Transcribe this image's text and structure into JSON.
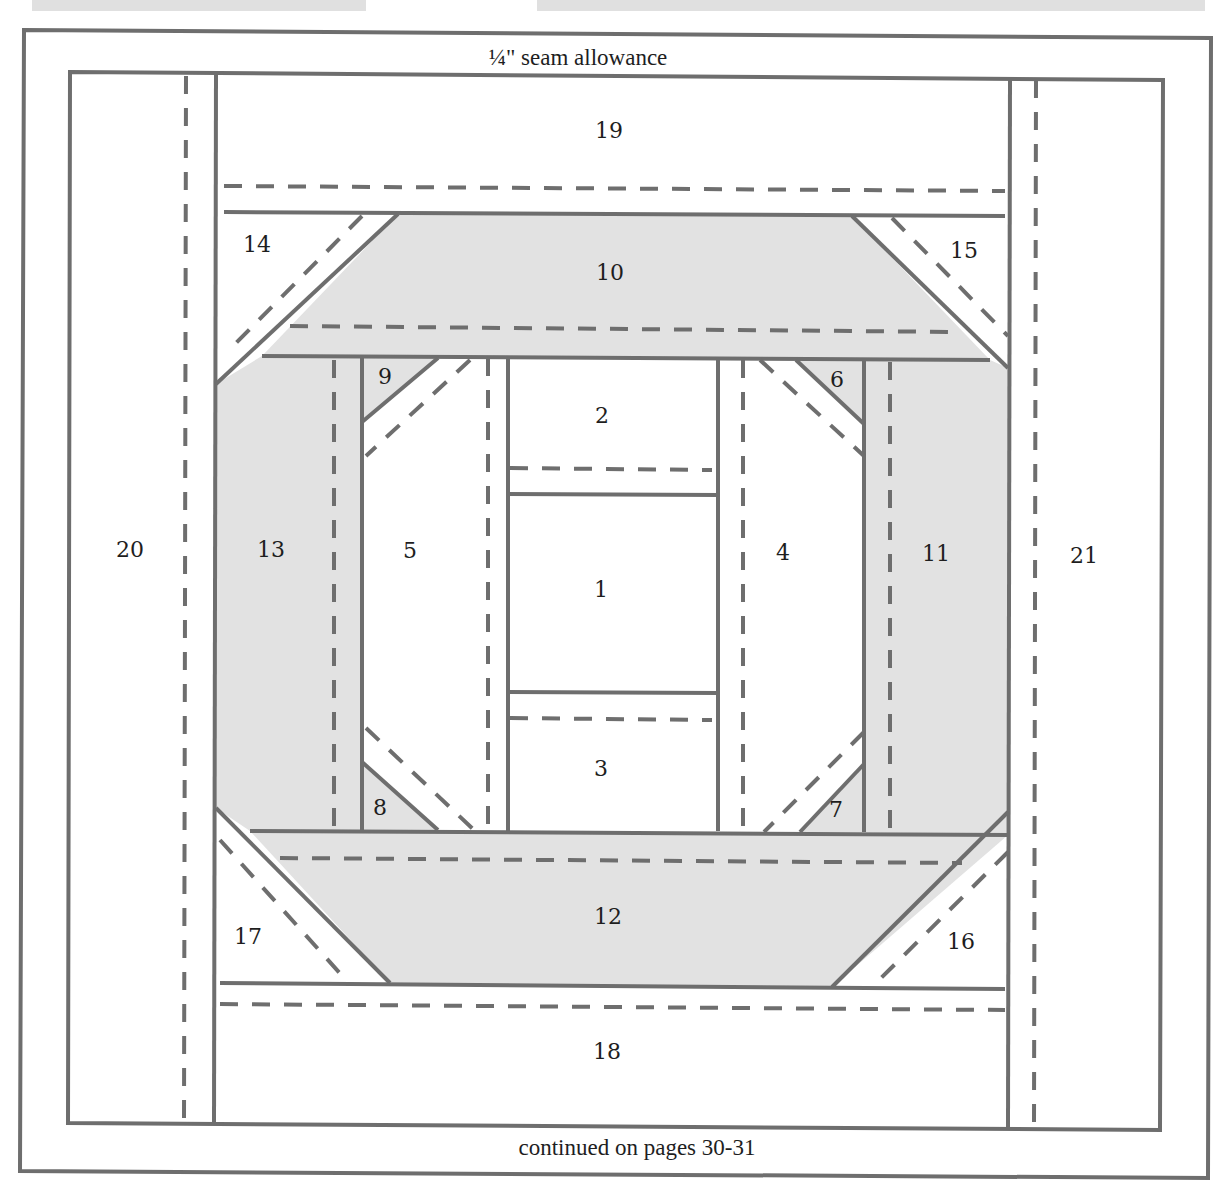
{
  "header": {
    "seam_label": "¼\" seam allowance"
  },
  "footer": {
    "continued_label": "continued on pages 30-31"
  },
  "colors": {
    "line": "#6e6e6e",
    "shaded_fabric": "#e2e2e2",
    "background": "#ffffff"
  },
  "pieces": [
    {
      "num": "1",
      "shaded": false
    },
    {
      "num": "2",
      "shaded": false
    },
    {
      "num": "3",
      "shaded": false
    },
    {
      "num": "4",
      "shaded": false
    },
    {
      "num": "5",
      "shaded": false
    },
    {
      "num": "6",
      "shaded": true
    },
    {
      "num": "7",
      "shaded": true
    },
    {
      "num": "8",
      "shaded": true
    },
    {
      "num": "9",
      "shaded": true
    },
    {
      "num": "10",
      "shaded": true
    },
    {
      "num": "11",
      "shaded": true
    },
    {
      "num": "12",
      "shaded": true
    },
    {
      "num": "13",
      "shaded": true
    },
    {
      "num": "14",
      "shaded": false
    },
    {
      "num": "15",
      "shaded": false
    },
    {
      "num": "16",
      "shaded": false
    },
    {
      "num": "17",
      "shaded": false
    },
    {
      "num": "18",
      "shaded": false
    },
    {
      "num": "19",
      "shaded": false
    },
    {
      "num": "20",
      "shaded": false
    },
    {
      "num": "21",
      "shaded": false
    }
  ]
}
